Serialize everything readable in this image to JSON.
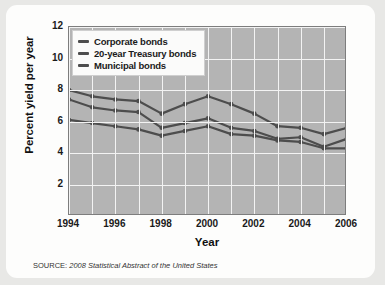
{
  "source": {
    "prefix": "SOURCE:",
    "citation": "2008 Statistical Abstract of the United States"
  },
  "chart_data": {
    "type": "line",
    "title": "",
    "xlabel": "Year",
    "ylabel": "Percent yield per year",
    "xlim": [
      1994,
      2006
    ],
    "ylim": [
      0,
      12
    ],
    "ytick_values": [
      2,
      4,
      6,
      8,
      10,
      12
    ],
    "ytick_labels": [
      "2",
      "4",
      "6",
      "8",
      "10",
      "12"
    ],
    "xtick_values": [
      1994,
      1996,
      1998,
      2000,
      2002,
      2004,
      2006
    ],
    "xtick_labels": [
      "1994",
      "1996",
      "1998",
      "2000",
      "2002",
      "2004",
      "2006"
    ],
    "x": [
      1994,
      1995,
      1996,
      1997,
      1998,
      1999,
      2000,
      2001,
      2002,
      2003,
      2004,
      2005,
      2006
    ],
    "grid": true,
    "grid_color": "#f3f3f3",
    "plot_background": "#b4b4b4",
    "legend_position": "upper-left",
    "line_color": "#4d4d4d",
    "marker": "circle",
    "series": [
      {
        "name": "Corporate bonds",
        "values": [
          8.0,
          7.6,
          7.4,
          7.3,
          6.5,
          7.1,
          7.6,
          7.1,
          6.5,
          5.7,
          5.6,
          5.2,
          5.6
        ]
      },
      {
        "name": "20-year Treasury bonds",
        "values": [
          7.4,
          6.9,
          6.7,
          6.6,
          5.6,
          5.9,
          6.2,
          5.6,
          5.4,
          4.9,
          5.0,
          4.4,
          4.9
        ]
      },
      {
        "name": "Municipal bonds",
        "values": [
          6.1,
          5.9,
          5.7,
          5.5,
          5.1,
          5.4,
          5.7,
          5.2,
          5.1,
          4.8,
          4.7,
          4.3,
          4.3
        ]
      }
    ]
  }
}
